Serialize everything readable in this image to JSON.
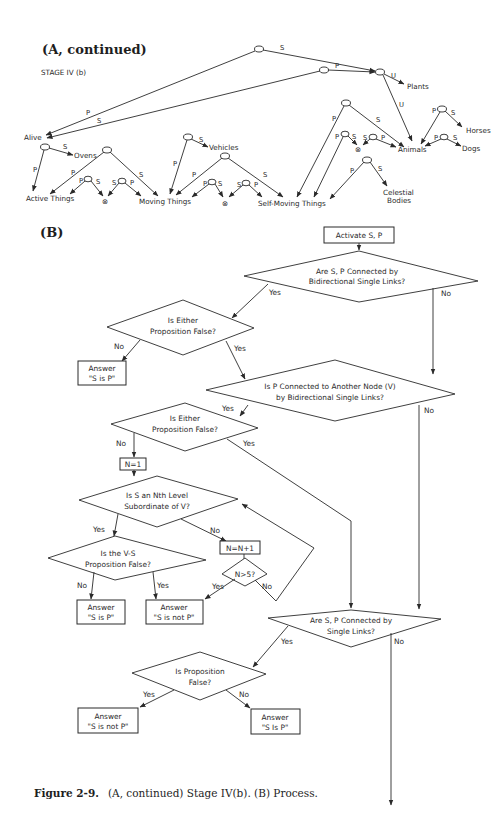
{
  "part_a": {
    "title": "(A, continued)",
    "subtitle": "STAGE IV (b)",
    "nodes": {
      "alive": "Alive",
      "plants": "Plants",
      "ovens": "Ovens",
      "vehicles": "Vehicles",
      "active_things": "Active Things",
      "moving_things": "Moving Things",
      "self_moving_things": "Self-Moving Things",
      "animals": "Animals",
      "horses": "Horses",
      "dogs": "Dogs",
      "celestial_1": "Celestial",
      "celestial_2": "Bodies",
      "null_symbol": "⊗"
    },
    "edge_labels": {
      "p": "P",
      "s": "S",
      "u": "U"
    }
  },
  "part_b": {
    "title": "(B)",
    "steps": {
      "activate": "Activate S, P",
      "q1_line1": "Are S, P Connected by",
      "q1_line2": "Bidirectional Single Links?",
      "q2_line1": "Is Either",
      "q2_line2": "Proposition False?",
      "ans1_line1": "Answer",
      "ans1_line2": "\"S is P\"",
      "q3_line1": "Is P Connected to Another Node (V)",
      "q3_line2": "by Bidirectional Single Links?",
      "q4_line1": "Is Either",
      "q4_line2": "Proposition False?",
      "n1": "N=1",
      "q5_line1": "Is S an Nth Level",
      "q5_line2": "Subordinate of V?",
      "nplus": "N=N+1",
      "q6": "N>5?",
      "q7_line1": "Is the V-S",
      "q7_line2": "Proposition False?",
      "ans2_line1": "Answer",
      "ans2_line2": "\"S is P\"",
      "ans3_line1": "Answer",
      "ans3_line2": "\"S is not P\"",
      "q8_line1": "Are S, P Connected by",
      "q8_line2": "Single Links?",
      "q9_line1": "Is Proposition",
      "q9_line2": "False?",
      "ans4_line1": "Answer",
      "ans4_line2": "\"S is not P\"",
      "ans5_line1": "Answer",
      "ans5_line2": "\"S Is P\""
    },
    "branch_labels": {
      "yes": "Yes",
      "no": "No"
    }
  },
  "caption": {
    "label": "Figure 2-9.",
    "text": "(A, continued) Stage IV(b). (B) Process."
  }
}
